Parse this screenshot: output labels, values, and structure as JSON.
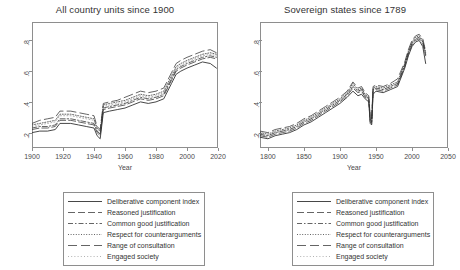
{
  "figure": {
    "background": "#ffffff",
    "line_color": "#333333",
    "axis_color": "#8e8e8e"
  },
  "panels": [
    {
      "id": "all-country-units",
      "title": "All country units since 1900",
      "xlabel": "Year",
      "xticks": [
        "1900",
        "1920",
        "1940",
        "1960",
        "1980",
        "2000",
        "2020"
      ],
      "yticks": [
        ".2",
        ".4",
        ".6",
        ".8"
      ]
    },
    {
      "id": "sovereign-states",
      "title": "Sovereign states since 1789",
      "xlabel": "Year",
      "xticks": [
        "1800",
        "1850",
        "1900",
        "1950",
        "2000",
        "2050"
      ],
      "yticks": [
        ".2",
        ".4",
        ".6",
        ".8"
      ]
    }
  ],
  "legend": {
    "entries": [
      {
        "label": "Deliberative component index",
        "style": "solid"
      },
      {
        "label": "Reasoned justification",
        "style": "long-dash"
      },
      {
        "label": "Common good justification",
        "style": "dash-dot"
      },
      {
        "label": "Respect for counterarguments",
        "style": "dotted"
      },
      {
        "label": "Range of consultation",
        "style": "wide-dash"
      },
      {
        "label": "Engaged society",
        "style": "faint"
      }
    ]
  },
  "chart_data": {
    "type": "line",
    "xlabel": "Year",
    "ylabel": "",
    "grid": false,
    "legend_position": "below",
    "panels": [
      {
        "title": "All country units since 1900",
        "xlim": [
          1900,
          2020
        ],
        "ylim": [
          0.1,
          0.92
        ],
        "xticks": [
          1900,
          1920,
          1940,
          1960,
          1980,
          2000,
          2020
        ],
        "yticks": [
          0.2,
          0.4,
          0.6,
          0.8
        ],
        "x": [
          1900,
          1905,
          1910,
          1915,
          1918,
          1920,
          1925,
          1930,
          1935,
          1940,
          1942,
          1944,
          1946,
          1950,
          1955,
          1960,
          1965,
          1970,
          1975,
          1980,
          1985,
          1990,
          1993,
          1996,
          2000,
          2005,
          2010,
          2015,
          2019
        ],
        "series": [
          {
            "name": "Deliberative component index",
            "style": "solid",
            "values": [
              0.2,
              0.21,
              0.21,
              0.22,
              0.26,
              0.26,
              0.26,
              0.25,
              0.24,
              0.23,
              0.18,
              0.16,
              0.33,
              0.34,
              0.35,
              0.36,
              0.38,
              0.4,
              0.39,
              0.4,
              0.42,
              0.52,
              0.58,
              0.6,
              0.62,
              0.64,
              0.66,
              0.65,
              0.62
            ]
          },
          {
            "name": "Reasoned justification",
            "style": "long-dash",
            "values": [
              0.22,
              0.23,
              0.23,
              0.24,
              0.28,
              0.28,
              0.28,
              0.27,
              0.26,
              0.25,
              0.2,
              0.18,
              0.35,
              0.36,
              0.37,
              0.38,
              0.4,
              0.42,
              0.41,
              0.42,
              0.44,
              0.54,
              0.6,
              0.62,
              0.64,
              0.66,
              0.68,
              0.69,
              0.68
            ]
          },
          {
            "name": "Common good justification",
            "style": "dash-dot",
            "values": [
              0.23,
              0.24,
              0.24,
              0.25,
              0.29,
              0.29,
              0.29,
              0.28,
              0.27,
              0.26,
              0.21,
              0.19,
              0.36,
              0.37,
              0.38,
              0.39,
              0.41,
              0.43,
              0.42,
              0.43,
              0.45,
              0.55,
              0.61,
              0.63,
              0.65,
              0.67,
              0.69,
              0.7,
              0.69
            ]
          },
          {
            "name": "Respect for counterarguments",
            "style": "dotted",
            "values": [
              0.25,
              0.26,
              0.27,
              0.28,
              0.32,
              0.32,
              0.32,
              0.31,
              0.3,
              0.29,
              0.23,
              0.21,
              0.38,
              0.39,
              0.4,
              0.41,
              0.43,
              0.45,
              0.44,
              0.45,
              0.47,
              0.57,
              0.63,
              0.65,
              0.67,
              0.69,
              0.71,
              0.72,
              0.71
            ]
          },
          {
            "name": "Range of consultation",
            "style": "wide-dash",
            "values": [
              0.26,
              0.28,
              0.29,
              0.3,
              0.34,
              0.34,
              0.34,
              0.33,
              0.32,
              0.31,
              0.24,
              0.22,
              0.39,
              0.4,
              0.41,
              0.43,
              0.45,
              0.47,
              0.46,
              0.47,
              0.49,
              0.59,
              0.65,
              0.67,
              0.69,
              0.71,
              0.73,
              0.74,
              0.72
            ]
          },
          {
            "name": "Engaged society",
            "style": "faint",
            "values": [
              0.24,
              0.25,
              0.26,
              0.27,
              0.31,
              0.31,
              0.31,
              0.3,
              0.29,
              0.28,
              0.22,
              0.2,
              0.37,
              0.38,
              0.39,
              0.4,
              0.42,
              0.44,
              0.43,
              0.44,
              0.46,
              0.56,
              0.62,
              0.64,
              0.66,
              0.68,
              0.7,
              0.71,
              0.7
            ]
          }
        ]
      },
      {
        "title": "Sovereign states since 1789",
        "xlim": [
          1789,
          2050
        ],
        "ylim": [
          0.1,
          0.92
        ],
        "xticks": [
          1800,
          1850,
          1900,
          1950,
          2000,
          2050
        ],
        "yticks": [
          0.2,
          0.4,
          0.6,
          0.8
        ],
        "x": [
          1789,
          1800,
          1810,
          1820,
          1830,
          1840,
          1850,
          1860,
          1870,
          1880,
          1890,
          1900,
          1910,
          1918,
          1925,
          1930,
          1935,
          1940,
          1942,
          1944,
          1946,
          1950,
          1960,
          1970,
          1980,
          1990,
          1995,
          2000,
          2005,
          2010,
          2015,
          2019
        ],
        "series": [
          {
            "name": "Deliberative component index",
            "style": "solid",
            "values": [
              0.17,
              0.16,
              0.18,
              0.19,
              0.2,
              0.22,
              0.25,
              0.27,
              0.3,
              0.33,
              0.36,
              0.39,
              0.43,
              0.47,
              0.44,
              0.45,
              0.42,
              0.4,
              0.26,
              0.25,
              0.45,
              0.47,
              0.46,
              0.48,
              0.5,
              0.62,
              0.7,
              0.76,
              0.79,
              0.8,
              0.76,
              0.65
            ]
          },
          {
            "name": "Reasoned justification",
            "style": "long-dash",
            "values": [
              0.18,
              0.17,
              0.19,
              0.2,
              0.21,
              0.23,
              0.26,
              0.28,
              0.31,
              0.34,
              0.37,
              0.4,
              0.44,
              0.49,
              0.46,
              0.47,
              0.43,
              0.41,
              0.27,
              0.26,
              0.47,
              0.48,
              0.47,
              0.49,
              0.51,
              0.63,
              0.71,
              0.77,
              0.8,
              0.81,
              0.78,
              0.7
            ]
          },
          {
            "name": "Common good justification",
            "style": "dash-dot",
            "values": [
              0.19,
              0.18,
              0.2,
              0.21,
              0.22,
              0.24,
              0.27,
              0.29,
              0.32,
              0.35,
              0.38,
              0.41,
              0.45,
              0.5,
              0.47,
              0.48,
              0.44,
              0.42,
              0.28,
              0.27,
              0.48,
              0.49,
              0.48,
              0.5,
              0.52,
              0.64,
              0.72,
              0.78,
              0.81,
              0.82,
              0.79,
              0.71
            ]
          },
          {
            "name": "Respect for counterarguments",
            "style": "dotted",
            "values": [
              0.2,
              0.19,
              0.21,
              0.22,
              0.23,
              0.25,
              0.28,
              0.3,
              0.33,
              0.36,
              0.39,
              0.42,
              0.46,
              0.52,
              0.48,
              0.49,
              0.45,
              0.43,
              0.29,
              0.28,
              0.49,
              0.5,
              0.49,
              0.51,
              0.53,
              0.65,
              0.73,
              0.79,
              0.82,
              0.83,
              0.8,
              0.72
            ]
          },
          {
            "name": "Range of consultation",
            "style": "wide-dash",
            "values": [
              0.21,
              0.2,
              0.22,
              0.23,
              0.24,
              0.26,
              0.29,
              0.31,
              0.34,
              0.37,
              0.4,
              0.43,
              0.47,
              0.53,
              0.49,
              0.5,
              0.46,
              0.44,
              0.3,
              0.29,
              0.5,
              0.51,
              0.5,
              0.52,
              0.55,
              0.66,
              0.74,
              0.8,
              0.83,
              0.84,
              0.81,
              0.73
            ]
          },
          {
            "name": "Engaged society",
            "style": "faint",
            "values": [
              0.18,
              0.18,
              0.2,
              0.21,
              0.22,
              0.24,
              0.27,
              0.29,
              0.32,
              0.35,
              0.38,
              0.41,
              0.45,
              0.51,
              0.47,
              0.48,
              0.44,
              0.42,
              0.28,
              0.27,
              0.48,
              0.49,
              0.48,
              0.5,
              0.52,
              0.64,
              0.72,
              0.78,
              0.81,
              0.82,
              0.79,
              0.71
            ]
          }
        ]
      }
    ]
  }
}
